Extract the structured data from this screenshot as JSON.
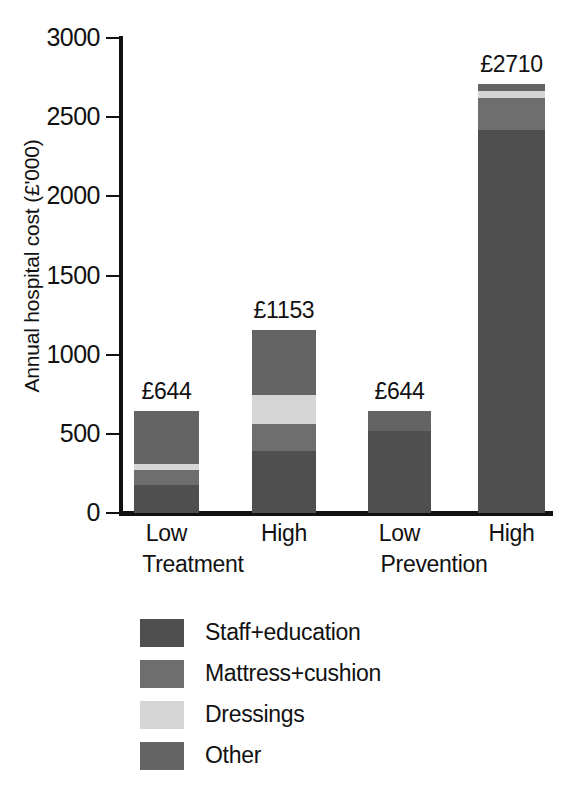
{
  "chart_data": {
    "type": "bar",
    "subtype": "stacked",
    "title": "",
    "xlabel": "",
    "ylabel": "Annual hospital cost (£'000)",
    "ylim": [
      0,
      3000
    ],
    "ytick_values": [
      0,
      500,
      1000,
      1500,
      2000,
      2500,
      3000
    ],
    "ytick_labels": [
      "0",
      "500",
      "1000",
      "1500",
      "2000",
      "2500",
      "3000"
    ],
    "grid": false,
    "legend_position": "bottom-left",
    "categories": [
      "Low",
      "High",
      "Low",
      "High"
    ],
    "groups": [
      {
        "name": "Treatment",
        "categories": [
          "Low",
          "High"
        ]
      },
      {
        "name": "Prevention",
        "categories": [
          "Low",
          "High"
        ]
      }
    ],
    "series": [
      {
        "name": "Staff+education",
        "color": "#4f4f4f",
        "values": [
          175,
          390,
          520,
          2420
        ]
      },
      {
        "name": "Mattress+cushion",
        "color": "#6e6e6e",
        "values": [
          95,
          170,
          0,
          200
        ]
      },
      {
        "name": "Dressings",
        "color": "#d5d5d5",
        "values": [
          40,
          185,
          0,
          45
        ]
      },
      {
        "name": "Other",
        "color": "#646464",
        "values": [
          334,
          408,
          124,
          45
        ]
      }
    ],
    "totals": [
      644,
      1153,
      644,
      2710
    ],
    "total_labels": [
      "£644",
      "£1153",
      "£644",
      "£2710"
    ]
  },
  "axis": {
    "y_title": "Annual hospital cost (£'000)",
    "ticks": [
      {
        "label": "3000",
        "value": 3000
      },
      {
        "label": "2500",
        "value": 2500
      },
      {
        "label": "2000",
        "value": 2000
      },
      {
        "label": "1500",
        "value": 1500
      },
      {
        "label": "1000",
        "value": 1000
      },
      {
        "label": "500",
        "value": 500
      },
      {
        "label": "0",
        "value": 0
      }
    ]
  },
  "bars": [
    {
      "label": "Low",
      "group": "Treatment",
      "value_label": "£644"
    },
    {
      "label": "High",
      "group": "Treatment",
      "value_label": "£1153"
    },
    {
      "label": "Low",
      "group": "Prevention",
      "value_label": "£644"
    },
    {
      "label": "High",
      "group": "Prevention",
      "value_label": "£2710"
    }
  ],
  "group_labels": [
    "Treatment",
    "Prevention"
  ],
  "legend": {
    "items": [
      {
        "label": "Staff+education",
        "color": "#4f4f4f"
      },
      {
        "label": "Mattress+cushion",
        "color": "#6e6e6e"
      },
      {
        "label": "Dressings",
        "color": "#d5d5d5"
      },
      {
        "label": "Other",
        "color": "#646464"
      }
    ]
  }
}
